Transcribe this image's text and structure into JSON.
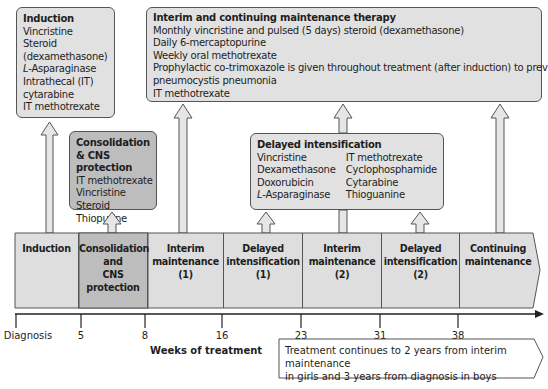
{
  "boxes": {
    "induction": {
      "title": "Induction",
      "items": [
        "Vincristine",
        "Steroid",
        "(dexamethasone)",
        "L",
        "-Asparaginase",
        "Intrathecal (IT)",
        " cytarabine",
        "IT methotrexate"
      ]
    },
    "consolidation": {
      "title": "Consolidation",
      "title2": "& CNS protection",
      "items": [
        "IT methotrexate",
        "Vincristine",
        "Steroid",
        "Thiopurine"
      ]
    },
    "maintenance": {
      "title": "Interim and continuing maintenance therapy",
      "items": [
        "Monthly vincristine and pulsed (5 days) steroid (dexamethasone)",
        "Daily 6-mercaptopurine",
        "Weekly oral methotrexate",
        "Prophylactic co-trimoxazole is given throughout treatment (after induction) to prevent",
        "pneumocystis pneumonia",
        "IT methotrexate"
      ]
    },
    "delayed": {
      "title": "Delayed intensification",
      "left": [
        "Vincristine",
        "Dexamethasone",
        "Doxorubicin",
        "-Asparaginase"
      ],
      "left_italic_prefix": "L",
      "right": [
        "IT methotrexate",
        "Cyclophosphamide",
        "Cytarabine",
        "Thioguanine"
      ]
    }
  },
  "phases": [
    {
      "l1": "Induction",
      "l2": "",
      "l3": "",
      "l4": ""
    },
    {
      "l1": "Consolidation",
      "l2": "and",
      "l3": "CNS",
      "l4": "protection"
    },
    {
      "l1": "Interim",
      "l2": "maintenance",
      "l3": "(1)",
      "l4": ""
    },
    {
      "l1": "Delayed",
      "l2": "intensification",
      "l3": "(1)",
      "l4": ""
    },
    {
      "l1": "Interim",
      "l2": "maintenance",
      "l3": "(2)",
      "l4": ""
    },
    {
      "l1": "Delayed",
      "l2": "intensification",
      "l3": "(2)",
      "l4": ""
    },
    {
      "l1": "Continuing",
      "l2": "maintenance",
      "l3": "",
      "l4": ""
    }
  ],
  "axis": {
    "ticks": [
      "Diagnosis",
      "5",
      "8",
      "16",
      "23",
      "31",
      "38"
    ],
    "label": "Weeks of treatment"
  },
  "note": {
    "line1": "Treatment continues to 2 years from interim maintenance",
    "line2": "in girls and 3 years from diagnosis in boys"
  },
  "colors": {
    "light_fill": "#e1e1e1",
    "dark_fill": "#bdbdbd",
    "border": "#555555"
  }
}
